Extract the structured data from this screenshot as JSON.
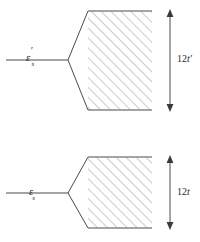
{
  "figure": {
    "background_color": "#ffffff",
    "line_color": "#4a4a4a",
    "hatch_color": "#8a8a8a",
    "text_color": "#2b2b2b"
  },
  "panels": [
    {
      "id": "top",
      "level_label": {
        "symbol": "ε",
        "prime": "′",
        "subscript": "s",
        "full": "ε′s"
      },
      "band_width_label": {
        "number": "12",
        "symbol": "t",
        "prime": "′",
        "full": "12t′"
      },
      "geometry": {
        "level_line_y": 60,
        "level_line_x1": 6,
        "level_line_x2": 68,
        "vertex_x": 68,
        "vertex_y": 60,
        "band_left_x": 88,
        "band_right_x": 152,
        "band_top_y": 11,
        "band_bottom_y": 110,
        "arrow_x": 170,
        "arrow_top_y": 11,
        "arrow_bottom_y": 110,
        "hatch_spacing": 7,
        "hatch_angle_deg": 45
      }
    },
    {
      "id": "bottom",
      "level_label": {
        "symbol": "ε",
        "prime": "",
        "subscript": "s",
        "full": "εs"
      },
      "band_width_label": {
        "number": "12",
        "symbol": "t",
        "prime": "",
        "full": "12t"
      },
      "geometry": {
        "level_line_y": 72,
        "level_line_x1": 6,
        "level_line_x2": 68,
        "vertex_x": 68,
        "vertex_y": 72,
        "band_left_x": 88,
        "band_right_x": 152,
        "band_top_y": 36,
        "band_bottom_y": 107,
        "arrow_x": 170,
        "arrow_top_y": 36,
        "arrow_bottom_y": 107,
        "hatch_spacing": 7,
        "hatch_angle_deg": 45
      }
    }
  ]
}
